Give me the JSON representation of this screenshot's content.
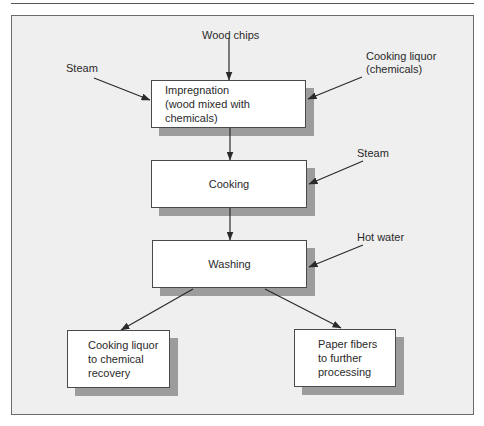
{
  "diagram": {
    "type": "flowchart",
    "title": "",
    "nodes": [
      {
        "id": "impregnation",
        "line1": "Impregnation",
        "line2": "(wood mixed with chemicals)"
      },
      {
        "id": "cooking",
        "text": "Cooking"
      },
      {
        "id": "washing",
        "text": "Washing"
      },
      {
        "id": "recovery",
        "line1": "Cooking liquor",
        "line2": "to chemical",
        "line3": "recovery"
      },
      {
        "id": "fibers",
        "line1": "Paper fibers",
        "line2": "to further",
        "line3": "processing"
      }
    ],
    "inputs": {
      "wood_chips": "Wood chips",
      "steam_left": "Steam",
      "cooking_liquor_1": "Cooking liquor",
      "cooking_liquor_2": "(chemicals)",
      "steam_right": "Steam",
      "hot_water": "Hot water"
    },
    "edges": [
      {
        "from": "Wood chips",
        "to": "impregnation"
      },
      {
        "from": "Steam",
        "to": "impregnation"
      },
      {
        "from": "Cooking liquor (chemicals)",
        "to": "impregnation"
      },
      {
        "from": "impregnation",
        "to": "cooking"
      },
      {
        "from": "Steam",
        "to": "cooking"
      },
      {
        "from": "cooking",
        "to": "washing"
      },
      {
        "from": "Hot water",
        "to": "washing"
      },
      {
        "from": "washing",
        "to": "recovery"
      },
      {
        "from": "washing",
        "to": "fibers"
      }
    ],
    "colors": {
      "panel_bg": "#efefef",
      "box_bg": "#ffffff",
      "shadow": "#9c9c9c",
      "line": "#2a2a2a"
    }
  }
}
